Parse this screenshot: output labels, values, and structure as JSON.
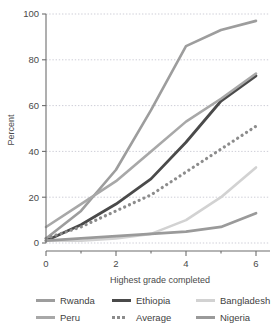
{
  "chart_data": {
    "type": "line",
    "title": "",
    "xlabel": "Highest grade completed",
    "ylabel": "Percent",
    "xlim": [
      0,
      6.4
    ],
    "ylim": [
      0,
      100
    ],
    "xticks": [
      0,
      2,
      4,
      6
    ],
    "xtick_labels": [
      "0",
      "2",
      "4",
      "6"
    ],
    "yticks": [
      0,
      20,
      40,
      60,
      80,
      100
    ],
    "ytick_labels": [
      "0",
      "20",
      "40",
      "60",
      "80",
      "100"
    ],
    "grid": true,
    "grid_style": "dotted-horizontal",
    "legend_position": "bottom",
    "x": [
      0,
      1,
      2,
      3,
      4,
      5,
      6
    ],
    "series": [
      {
        "name": "Rwanda",
        "color": "#9d9d9d",
        "style": "solid",
        "width": 2.6,
        "values": [
          2,
          14,
          32,
          58,
          86,
          93,
          97
        ]
      },
      {
        "name": "Ethiopia",
        "color": "#4a4a4a",
        "style": "solid",
        "width": 2.8,
        "values": [
          1,
          8,
          17,
          28,
          44,
          62,
          73
        ]
      },
      {
        "name": "Bangladesh",
        "color": "#d2d2d2",
        "style": "solid",
        "width": 2.6,
        "values": [
          1,
          1,
          2,
          4,
          10,
          20,
          33
        ]
      },
      {
        "name": "Peru",
        "color": "#a8a8a8",
        "style": "solid",
        "width": 2.6,
        "values": [
          7,
          17,
          27,
          40,
          53,
          63,
          74
        ]
      },
      {
        "name": "Average",
        "color": "#8c8c8c",
        "style": "dotted",
        "width": 3.2,
        "values": [
          2,
          7,
          14,
          21,
          31,
          41,
          51
        ]
      },
      {
        "name": "Nigeria",
        "color": "#9a9a9a",
        "style": "solid",
        "width": 2.8,
        "values": [
          1,
          2,
          3,
          4,
          5,
          7,
          13
        ]
      }
    ]
  },
  "legend": {
    "items": [
      {
        "label": "Rwanda",
        "series": "Rwanda"
      },
      {
        "label": "Ethiopia",
        "series": "Ethiopia"
      },
      {
        "label": "Bangladesh",
        "series": "Bangladesh"
      },
      {
        "label": "Peru",
        "series": "Peru"
      },
      {
        "label": "Average",
        "series": "Average"
      },
      {
        "label": "Nigeria",
        "series": "Nigeria"
      }
    ]
  }
}
